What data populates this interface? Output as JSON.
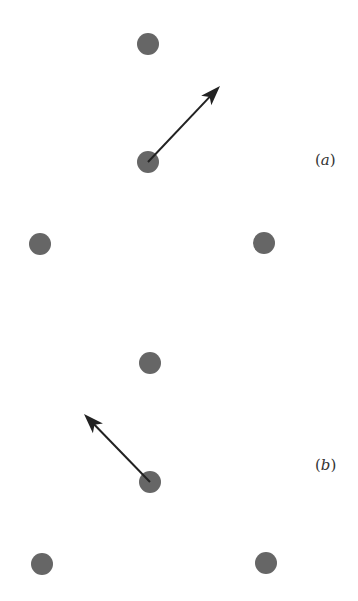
{
  "colors": {
    "dot": "#666666",
    "arrow": "#222222",
    "background": "#ffffff"
  },
  "panels": [
    {
      "label": "(a)",
      "label_letter": "a",
      "label_pos": [
        315,
        165
      ],
      "dots": [
        [
          148,
          44
        ],
        [
          148,
          162
        ],
        [
          40,
          244
        ],
        [
          264,
          243
        ]
      ],
      "arrow": {
        "from": [
          148,
          162
        ],
        "to": [
          220,
          86
        ]
      }
    },
    {
      "label": "(b)",
      "label_letter": "b",
      "label_pos": [
        315,
        470
      ],
      "dots": [
        [
          150,
          363
        ],
        [
          150,
          482
        ],
        [
          42,
          564
        ],
        [
          266,
          563
        ]
      ],
      "arrow": {
        "from": [
          150,
          482
        ],
        "to": [
          84,
          414
        ]
      }
    }
  ]
}
